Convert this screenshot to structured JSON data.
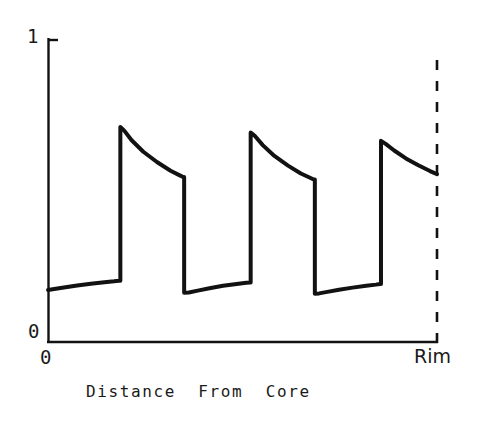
{
  "figure": {
    "width": 482,
    "height": 427,
    "background_color": "#ffffff",
    "ink_color": "#121212"
  },
  "chart_data": {
    "type": "line",
    "title": "",
    "subtitle": "",
    "xlabel": "Distance  From  Core",
    "ylabel": "",
    "xlim": [
      0,
      1
    ],
    "ylim": [
      0,
      1
    ],
    "grid": false,
    "legend": null,
    "x_tick_labels": [
      "0",
      "Rim"
    ],
    "x_tick_positions": [
      0,
      1
    ],
    "y_tick_labels": [
      "0",
      "1"
    ],
    "y_tick_positions": [
      0,
      1
    ],
    "annotations": [
      {
        "name": "rim-boundary",
        "kind": "vertical-dashed-line",
        "x": 1.0,
        "label": "Rim"
      }
    ],
    "series": [
      {
        "name": "profile",
        "style": "solid",
        "color": "#121212",
        "linewidth": 4,
        "x": [
          0.0,
          0.02,
          0.045,
          0.075,
          0.11,
          0.145,
          0.17,
          0.182,
          0.186,
          0.186,
          0.196,
          0.215,
          0.245,
          0.28,
          0.315,
          0.34,
          0.347,
          0.35,
          0.35,
          0.362,
          0.385,
          0.415,
          0.45,
          0.485,
          0.51,
          0.519,
          0.521,
          0.521,
          0.532,
          0.552,
          0.582,
          0.617,
          0.65,
          0.675,
          0.683,
          0.686,
          0.686,
          0.697,
          0.718,
          0.748,
          0.783,
          0.818,
          0.843,
          0.853,
          0.856,
          0.856,
          0.868,
          0.89,
          0.92,
          0.952,
          0.982,
          1.0
        ],
        "y": [
          0.172,
          0.176,
          0.181,
          0.187,
          0.193,
          0.198,
          0.201,
          0.203,
          0.203,
          0.712,
          0.7,
          0.668,
          0.63,
          0.596,
          0.567,
          0.551,
          0.546,
          0.546,
          0.163,
          0.164,
          0.17,
          0.178,
          0.186,
          0.192,
          0.196,
          0.197,
          0.197,
          0.694,
          0.682,
          0.652,
          0.616,
          0.584,
          0.558,
          0.543,
          0.538,
          0.538,
          0.16,
          0.161,
          0.166,
          0.173,
          0.18,
          0.186,
          0.19,
          0.192,
          0.192,
          0.666,
          0.656,
          0.634,
          0.608,
          0.585,
          0.566,
          0.556
        ]
      }
    ]
  },
  "labels": {
    "y_top": "1",
    "y_bottom": "0",
    "x_left": "0",
    "x_right": "Rim",
    "x_title": "Distance  From  Core"
  }
}
